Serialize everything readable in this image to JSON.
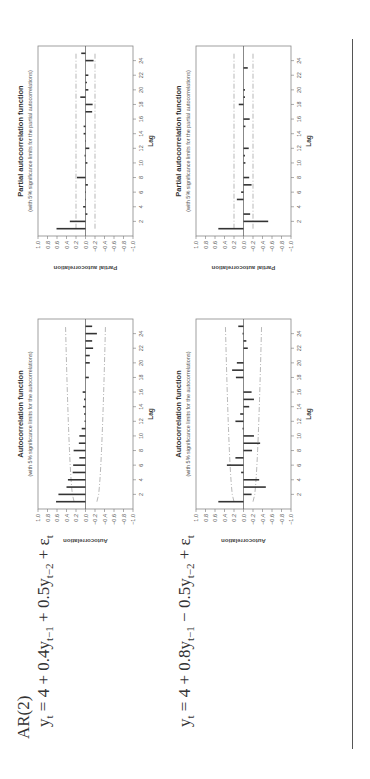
{
  "equations": {
    "model_label": "AR(2)",
    "eq1": "y_t = 4 + 0.4y_{t−1} + 0.5y_{t−2} + ε_t",
    "eq2": "y_t = 4 + 0.8y_{t−1} − 0.5y_{t−2} + ε_t"
  },
  "chart_data": [
    {
      "id": "acf1",
      "type": "bar",
      "title": "Autocorrelation function",
      "subtitle": "(with 5% significance limits for the autocorrelations)",
      "xlabel": "Lag",
      "ylabel": "Autocorrelation",
      "ylim": [
        -1.0,
        1.0
      ],
      "yticks": [
        "1.0",
        "0.8",
        "0.6",
        "0.4",
        "0.2",
        "0.0",
        "−0.2",
        "−0.4",
        "−0.6",
        "−0.8",
        "−1.0"
      ],
      "xticks": [
        2,
        4,
        6,
        8,
        10,
        12,
        14,
        16,
        18,
        20,
        22,
        24
      ],
      "lags": [
        1,
        2,
        3,
        4,
        5,
        6,
        7,
        8,
        9,
        10,
        11,
        12,
        13,
        14,
        15,
        16,
        17,
        18,
        19,
        20,
        21,
        22,
        23,
        24,
        25
      ],
      "values": [
        0.62,
        0.57,
        0.4,
        0.37,
        0.27,
        0.26,
        0.13,
        0.25,
        0.14,
        0.13,
        0.08,
        0.02,
        0.03,
        0.05,
        0.03,
        0.06,
        0.0,
        -0.07,
        0.0,
        -0.09,
        -0.09,
        -0.16,
        -0.14,
        -0.24,
        -0.14
      ],
      "limit_start": 0.24,
      "limit_end": 0.42
    },
    {
      "id": "pacf1",
      "type": "bar",
      "title": "Partial autocorrelation function",
      "subtitle": "(with 5% significance limits for the partial autocorrelations)",
      "xlabel": "Lag",
      "ylabel": "Partial autocorrelation",
      "ylim": [
        -1.0,
        1.0
      ],
      "yticks": [
        "1.0",
        "0.8",
        "0.6",
        "0.4",
        "0.2",
        "0.0",
        "−0.2",
        "−0.4",
        "−0.6",
        "−0.8",
        "−1.0"
      ],
      "xticks": [
        2,
        4,
        6,
        8,
        10,
        12,
        14,
        16,
        18,
        20,
        22,
        24
      ],
      "lags": [
        1,
        2,
        3,
        4,
        5,
        6,
        7,
        8,
        9,
        10,
        11,
        12,
        13,
        14,
        15,
        16,
        17,
        18,
        19,
        20,
        21,
        22,
        23,
        24,
        25
      ],
      "values": [
        0.61,
        0.33,
        -0.04,
        0.05,
        -0.01,
        0.01,
        -0.05,
        0.18,
        0.0,
        -0.04,
        0.02,
        -0.08,
        -0.01,
        0.04,
        0.04,
        0.0,
        -0.14,
        -0.15,
        0.11,
        -0.06,
        -0.03,
        -0.06,
        0.0,
        -0.17,
        0.09
      ],
      "limit_start": 0.2,
      "limit_end": 0.2
    },
    {
      "id": "acf2",
      "type": "bar",
      "title": "Autocorrelation function",
      "subtitle": "(with 5% significance limits for the autocorrelations)",
      "xlabel": "Lag",
      "ylabel": "Autocorrelation",
      "ylim": [
        -1.0,
        1.0
      ],
      "yticks": [
        "1.0",
        "0.8",
        "0.6",
        "0.4",
        "0.2",
        "0.0",
        "−0.2",
        "−0.4",
        "−0.6",
        "−0.8",
        "−1.0"
      ],
      "xticks": [
        2,
        4,
        6,
        8,
        10,
        12,
        14,
        16,
        18,
        20,
        22,
        24
      ],
      "lags": [
        1,
        2,
        3,
        4,
        5,
        6,
        7,
        8,
        9,
        10,
        11,
        12,
        13,
        14,
        15,
        16,
        17,
        18,
        19,
        20,
        21,
        22,
        23,
        24,
        25
      ],
      "values": [
        0.53,
        -0.17,
        -0.47,
        -0.33,
        0.05,
        0.35,
        0.17,
        -0.18,
        -0.35,
        -0.22,
        0.02,
        0.17,
        0.07,
        -0.12,
        -0.22,
        -0.17,
        0.0,
        0.16,
        0.24,
        0.14,
        0.0,
        -0.09,
        -0.06,
        0.02,
        0.11
      ],
      "limit_start": 0.2,
      "limit_end": 0.38
    },
    {
      "id": "pacf2",
      "type": "bar",
      "title": "Partial autocorrelation function",
      "subtitle": "(with 5% significance limits for the partial autocorrelations)",
      "xlabel": "Lag",
      "ylabel": "Partial autocorrelation",
      "ylim": [
        -1.0,
        1.0
      ],
      "yticks": [
        "1.0",
        "0.8",
        "0.6",
        "0.4",
        "0.2",
        "0.0",
        "−0.2",
        "−0.4",
        "−0.6",
        "−0.8",
        "−1.0"
      ],
      "xticks": [
        2,
        4,
        6,
        8,
        10,
        12,
        14,
        16,
        18,
        20,
        22,
        24
      ],
      "lags": [
        1,
        2,
        3,
        4,
        5,
        6,
        7,
        8,
        9,
        10,
        11,
        12,
        13,
        14,
        15,
        16,
        17,
        18,
        19,
        20,
        21,
        22,
        23,
        24,
        25
      ],
      "values": [
        0.53,
        -0.52,
        -0.14,
        0.0,
        0.14,
        0.05,
        -0.17,
        -0.12,
        0.0,
        -0.04,
        -0.03,
        -0.11,
        0.0,
        0.0,
        -0.04,
        -0.13,
        0.0,
        0.1,
        -0.03,
        -0.03,
        0.0,
        0.0,
        -0.09,
        0.0,
        0.0
      ],
      "limit_start": 0.2,
      "limit_end": 0.2
    }
  ]
}
